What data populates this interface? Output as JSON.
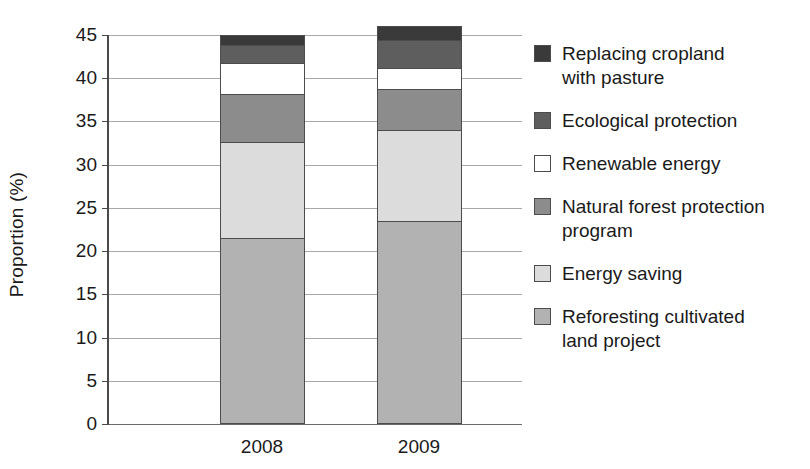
{
  "chart_data": {
    "type": "bar",
    "subtype": "stacked-bar",
    "title": "",
    "xlabel": "",
    "ylabel": "Proportion (%)",
    "categories": [
      "2008",
      "2009"
    ],
    "ylim": [
      0,
      45
    ],
    "yticks": [
      0,
      5,
      10,
      15,
      20,
      25,
      30,
      35,
      40,
      45
    ],
    "ytick_labels": [
      "0",
      "5",
      "10",
      "15",
      "20",
      "25",
      "30",
      "35",
      "40",
      "45"
    ],
    "grid": true,
    "legend_position": "right",
    "stack_order_bottom_to_top": [
      "Reforesting cultivated land project",
      "Energy saving",
      "Natural forest protection program",
      "Renewable energy",
      "Ecological protection",
      "Replacing cropland with pasture"
    ],
    "series": [
      {
        "name": "Reforesting cultivated land project",
        "legend_label": "Reforesting cultivated\nland project",
        "color": "#b2b2b2",
        "values": [
          21.5,
          23.5
        ]
      },
      {
        "name": "Energy saving",
        "legend_label": "Energy saving",
        "color": "#dcdcdc",
        "values": [
          11.1,
          10.5
        ]
      },
      {
        "name": "Natural forest protection program",
        "legend_label": "Natural forest protection\nprogram",
        "color": "#8c8c8c",
        "values": [
          5.6,
          4.8
        ]
      },
      {
        "name": "Renewable energy",
        "legend_label": "Renewable energy",
        "color": "#ffffff",
        "values": [
          3.6,
          2.4
        ]
      },
      {
        "name": "Ecological protection",
        "legend_label": "Ecological protection",
        "color": "#5e5e5e",
        "values": [
          2.0,
          3.2
        ]
      },
      {
        "name": "Replacing cropland with pasture",
        "legend_label": "Replacing cropland\nwith pasture",
        "color": "#3a3a3a",
        "values": [
          1.2,
          1.6
        ]
      }
    ],
    "cumulative_tops": {
      "2008": [
        21.5,
        32.6,
        38.2,
        41.8,
        43.8,
        45.0
      ],
      "2009": [
        23.5,
        34.0,
        38.8,
        41.2,
        44.4,
        46.0
      ]
    },
    "totals": [
      45.0,
      46.0
    ]
  },
  "axis": {
    "y_title": "Proportion (%)",
    "ticks": [
      {
        "value": 45,
        "label": "45"
      },
      {
        "value": 40,
        "label": "40"
      },
      {
        "value": 35,
        "label": "35"
      },
      {
        "value": 30,
        "label": "30"
      },
      {
        "value": 25,
        "label": "25"
      },
      {
        "value": 20,
        "label": "20"
      },
      {
        "value": 15,
        "label": "15"
      },
      {
        "value": 10,
        "label": "10"
      },
      {
        "value": 5,
        "label": "5"
      },
      {
        "value": 0,
        "label": "0"
      }
    ],
    "x_categories": [
      {
        "label": "2008"
      },
      {
        "label": "2009"
      }
    ]
  },
  "legend": {
    "items": [
      {
        "label": "Replacing cropland\nwith pasture",
        "color": "#3a3a3a"
      },
      {
        "label": "Ecological protection",
        "color": "#5e5e5e"
      },
      {
        "label": "Renewable energy",
        "color": "#ffffff"
      },
      {
        "label": "Natural forest protection\nprogram",
        "color": "#8c8c8c"
      },
      {
        "label": "Energy saving",
        "color": "#dcdcdc"
      },
      {
        "label": "Reforesting cultivated\nland project",
        "color": "#b2b2b2"
      }
    ]
  }
}
